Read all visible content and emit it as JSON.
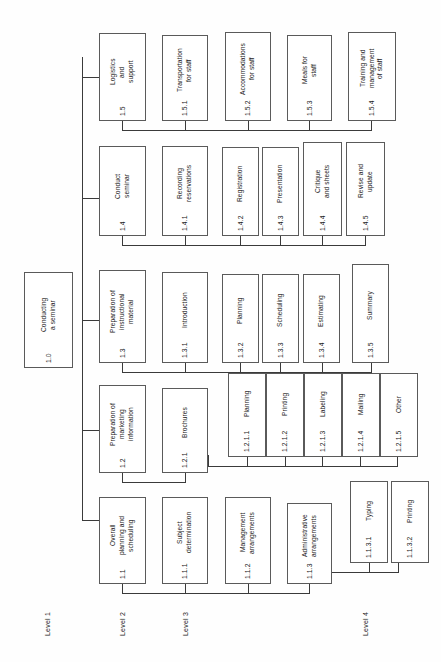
{
  "diagram": {
    "orientation": "rotated-90-ccw",
    "line_color": "#3a3a3a",
    "box_border_color": "#5a5a5a",
    "box_fill_color": "#ffffff"
  },
  "levels": [
    {
      "id": "level-1",
      "label": "Level 1"
    },
    {
      "id": "level-2",
      "label": "Level 2"
    },
    {
      "id": "level-3",
      "label": "Level 3"
    },
    {
      "id": "level-4",
      "label": "Level 4"
    }
  ],
  "root": {
    "label": "Conducting\na seminar",
    "code": "1.0"
  },
  "level2": [
    {
      "label": "Overall\nplanning and\nscheduling",
      "code": "1.1"
    },
    {
      "label": "Preparation of\nmarketing\ninformation",
      "code": "1.2"
    },
    {
      "label": "Preparation of\ninstructional\nmaterial",
      "code": "1.3"
    },
    {
      "label": "Conduct\nseminar",
      "code": "1.4"
    },
    {
      "label": "Logistics\nand\nsupport",
      "code": "1.5"
    }
  ],
  "branch_1_1": [
    {
      "label": "Subject\ndetermination",
      "code": "1.1.1"
    },
    {
      "label": "Management\narrangements",
      "code": "1.1.2"
    },
    {
      "label": "Administrative\narrangements",
      "code": "1.1.3"
    }
  ],
  "branch_1_1_3": [
    {
      "label": "Typing",
      "code": "1.1.3.1"
    },
    {
      "label": "Printing",
      "code": "1.1.3.2"
    }
  ],
  "branch_1_2": [
    {
      "label": "Brochures",
      "code": "1.2.1"
    }
  ],
  "branch_1_2_1": [
    {
      "label": "Planning",
      "code": "1.2.1.1"
    },
    {
      "label": "Printing",
      "code": "1.2.1.2"
    },
    {
      "label": "Labeling",
      "code": "1.2.1.3"
    },
    {
      "label": "Mailing",
      "code": "1.2.1.4"
    },
    {
      "label": "Other",
      "code": "1.2.1.5"
    }
  ],
  "branch_1_3": [
    {
      "label": "Introduction",
      "code": "1.3.1"
    },
    {
      "label": "Planning",
      "code": "1.3.2"
    },
    {
      "label": "Scheduling",
      "code": "1.3.3"
    },
    {
      "label": "Estimating",
      "code": "1.3.4"
    },
    {
      "label": "Summary",
      "code": "1.3.5"
    }
  ],
  "branch_1_4": [
    {
      "label": "Recording\nreservations",
      "code": "1.4.1"
    },
    {
      "label": "Registration",
      "code": "1.4.2"
    },
    {
      "label": "Presentation",
      "code": "1.4.3"
    },
    {
      "label": "Critique\nand sheets",
      "code": "1.4.4"
    },
    {
      "label": "Revise and\nupdate",
      "code": "1.4.5"
    }
  ],
  "branch_1_5": [
    {
      "label": "Transportation\nfor staff",
      "code": "1.5.1"
    },
    {
      "label": "Accommodations\nfor staff",
      "code": "1.5.2"
    },
    {
      "label": "Meals for\nstaff",
      "code": "1.5.3"
    },
    {
      "label": "Training and\nmanagement\nof staff",
      "code": "1.5.4"
    }
  ]
}
